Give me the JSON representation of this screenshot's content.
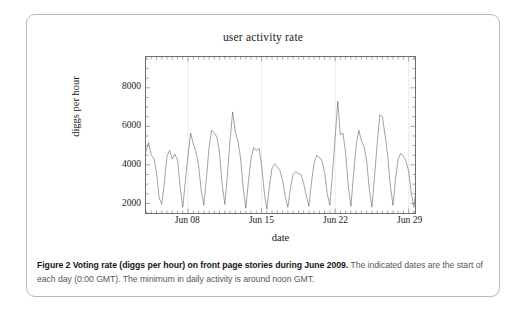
{
  "figure": {
    "caption_bold": "Figure 2  Voting rate (diggs per hour) on front page stories during June 2009.",
    "caption_rest": " The indicated dates are the start of each day (0:00 GMT). The minimum in daily activity is around noon GMT."
  },
  "chart_data": {
    "type": "line",
    "title": "user activity rate",
    "xlabel": "date",
    "ylabel": "diggs per hour",
    "grid": "faint vertical gridlines at labeled date ticks",
    "legend": "none",
    "line_color": "#555555",
    "xlim": [
      4.0,
      29.6
    ],
    "ylim": [
      1500,
      9600
    ],
    "yticks": [
      2000,
      4000,
      6000,
      8000
    ],
    "ytick_labels": [
      "2000",
      "4000",
      "6000",
      "8000"
    ],
    "xticks": [
      8,
      15,
      22,
      29
    ],
    "xtick_labels": [
      "Jun 08",
      "Jun 15",
      "Jun 22",
      "Jun 29"
    ],
    "x_unit": "day of June 2009 (hourly samples)",
    "x_start": 4.0,
    "x_step": 0.25,
    "values": [
      4700,
      5150,
      4500,
      4350,
      3600,
      2300,
      1950,
      3100,
      4450,
      4750,
      4300,
      4550,
      4250,
      2850,
      1800,
      3200,
      4500,
      5650,
      5100,
      4700,
      4000,
      2700,
      1900,
      3300,
      4900,
      5800,
      5650,
      5450,
      4600,
      3000,
      1950,
      3500,
      5300,
      6750,
      5700,
      5250,
      4350,
      2800,
      1750,
      3150,
      4350,
      4900,
      4750,
      4850,
      4000,
      2600,
      1700,
      2900,
      3850,
      4050,
      3900,
      3700,
      3200,
      2350,
      1800,
      2800,
      3500,
      3650,
      3550,
      3500,
      3050,
      2400,
      1850,
      3100,
      4100,
      4500,
      4400,
      4200,
      3600,
      2500,
      1900,
      3600,
      5400,
      7300,
      5550,
      5650,
      4600,
      2900,
      1850,
      3500,
      5000,
      5800,
      5250,
      4950,
      4200,
      2750,
      1800,
      3400,
      5100,
      6600,
      6500,
      5550,
      4500,
      2950,
      1900,
      3300,
      4300,
      4600,
      4450,
      4200,
      3650,
      2500,
      1800,
      3000,
      3800,
      4050,
      3900,
      3700,
      3100,
      2300,
      1750,
      2900,
      4200,
      5900,
      4550,
      4300,
      3500,
      2400,
      1700,
      2750,
      3400,
      3600,
      3450,
      3350,
      2950,
      2250,
      1750,
      2700,
      3300,
      3500,
      3400,
      3250,
      2850,
      2150,
      1700,
      3000,
      4100,
      4650,
      4500,
      4300,
      3700,
      2600,
      1900,
      3700,
      5450,
      7750,
      5400,
      5000,
      4300,
      2900,
      1900,
      3650,
      5150,
      6550,
      5900,
      5800,
      4800,
      3050,
      1950,
      3500,
      5100,
      5900,
      5750,
      5500,
      4650,
      3050,
      1950,
      3300,
      4700,
      5200,
      5050,
      4850,
      4150,
      2800,
      1850,
      3200,
      4450,
      4700,
      4550,
      4400,
      3750,
      2600,
      1800,
      3300,
      4950,
      5750,
      5500,
      5100,
      4300,
      2850,
      1800,
      3150,
      3700,
      3900,
      3750,
      3600,
      3100,
      2350,
      1750,
      2900,
      4000,
      4250,
      4150,
      4050,
      3550,
      2500,
      1850,
      3700,
      5200,
      7200,
      5600,
      5250,
      4500,
      3000,
      2000,
      3800,
      5400,
      6100,
      5950,
      5700,
      4750,
      3100,
      2000,
      3750,
      5500,
      6400,
      6250,
      6050,
      5000,
      3200,
      2050,
      3800,
      5700,
      6600,
      6450,
      6150,
      5150,
      3250,
      2050,
      4000,
      6000,
      9500,
      6950,
      6300,
      5300,
      3300,
      2050,
      3900,
      5700,
      6300,
      6150,
      5800,
      4900,
      3150,
      1950,
      3200,
      4000,
      4250,
      4100,
      3900,
      3350,
      2400,
      1800,
      2900,
      3800,
      4200,
      4050,
      3850,
      3300,
      2350,
      1800,
      3400,
      4800,
      6000,
      4800,
      4500,
      3800,
      2600,
      1850,
      2400
    ]
  }
}
